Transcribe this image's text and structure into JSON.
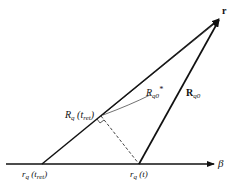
{
  "diagram": {
    "colors": {
      "line": "#111111",
      "background": "#ffffff"
    },
    "points": {
      "r": {
        "label": "r",
        "x": 221,
        "y": 17
      },
      "rq_tret": {
        "label_main": "r",
        "label_sub": "q",
        "label_arg": "(t",
        "label_arg_sub": "ret",
        "label_close": ")",
        "x": 42,
        "y": 164
      },
      "rq_t": {
        "label_main": "r",
        "label_sub": "q",
        "label_arg": "(t)",
        "x": 139,
        "y": 164
      },
      "foot": {
        "x": 101,
        "y": 116
      }
    },
    "labels": {
      "r": "r",
      "beta": "β",
      "Rq_tret": {
        "main": "R",
        "sub": "q",
        "arg": "(t",
        "arg_sub": "ret",
        "close": ")"
      },
      "Rq0_star": {
        "main": "R",
        "sub": "q0",
        "sup": "*"
      },
      "Rq0_bold": {
        "main": "R",
        "sub": "q0"
      }
    }
  }
}
